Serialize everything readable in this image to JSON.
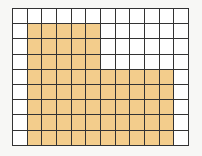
{
  "grid": {
    "cols": 12,
    "rows": 9,
    "cell_width": 14.67,
    "cell_height": 15.2,
    "fill_color": "#f3cd8c",
    "empty_color": "#ffffff",
    "line_color": "#333333",
    "filled_regions": [
      {
        "rows": [
          1,
          3
        ],
        "cols": [
          1,
          5
        ]
      },
      {
        "rows": [
          4,
          8
        ],
        "cols": [
          1,
          10
        ]
      }
    ],
    "filled_count": 65,
    "total_count": 108
  }
}
